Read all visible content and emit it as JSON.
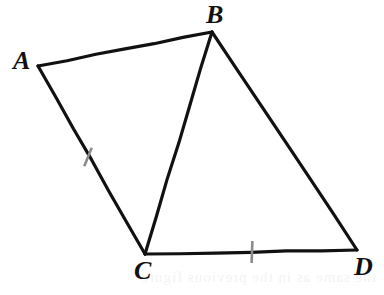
{
  "figure": {
    "background_color": "#ffffff",
    "stroke_color": "#111111",
    "tick_color": "#8c8c8c",
    "label_color": "#111111",
    "stroke_width": 3.2,
    "vertices": [
      {
        "name": "A",
        "label": "A",
        "x": 38,
        "y": 66,
        "label_x": 13,
        "label_y": 48
      },
      {
        "name": "B",
        "label": "B",
        "x": 212,
        "y": 32,
        "label_x": 206,
        "label_y": 2
      },
      {
        "name": "C",
        "label": "C",
        "x": 145,
        "y": 254,
        "label_x": 134,
        "label_y": 258
      },
      {
        "name": "D",
        "label": "D",
        "x": 357,
        "y": 250,
        "label_x": 354,
        "label_y": 254
      }
    ],
    "segments": [
      {
        "name": "segment-ab",
        "from": "A",
        "to": "B"
      },
      {
        "name": "segment-ac",
        "from": "A",
        "to": "C"
      },
      {
        "name": "segment-bc",
        "from": "B",
        "to": "C"
      },
      {
        "name": "segment-bd",
        "from": "B",
        "to": "D"
      },
      {
        "name": "segment-cd",
        "from": "C",
        "to": "D"
      }
    ],
    "tick_marks": [
      {
        "name": "tick-mark-ac",
        "on_segment": "segment-ac",
        "x": 88,
        "y": 157,
        "angle_deg": 112,
        "length": 20
      },
      {
        "name": "tick-mark-cd",
        "on_segment": "segment-cd",
        "x": 252,
        "y": 252,
        "angle_deg": 92,
        "length": 22
      }
    ],
    "bleed_text": "the same as in the previous figure"
  }
}
